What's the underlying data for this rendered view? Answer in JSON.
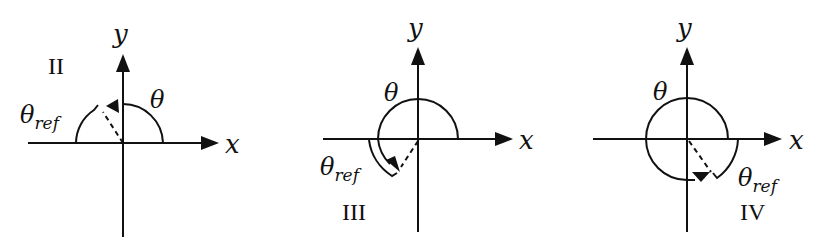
{
  "diagrams": [
    {
      "quadrant": "II",
      "x_label": "x",
      "y_label": "y",
      "theta_label": "θ",
      "ref_label_base": "θ",
      "ref_label_sub": "ref"
    },
    {
      "quadrant": "III",
      "x_label": "x",
      "y_label": "y",
      "theta_label": "θ",
      "ref_label_base": "θ",
      "ref_label_sub": "ref"
    },
    {
      "quadrant": "IV",
      "x_label": "x",
      "y_label": "y",
      "theta_label": "θ",
      "ref_label_base": "θ",
      "ref_label_sub": "ref"
    }
  ]
}
